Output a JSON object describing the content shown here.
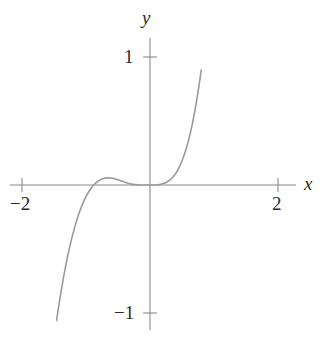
{
  "figure": {
    "background_color": "#ffffff",
    "axis_color": "#8a8a8a",
    "curve_color": "#9a9a9a",
    "text_color": "#2b2b2b"
  },
  "labels": {
    "x_axis": "x",
    "y_axis": "y"
  },
  "ticks": {
    "x_neg2": "−2",
    "x_pos2": "2",
    "y_pos1": "1",
    "y_neg1": "−1"
  },
  "chart_data": {
    "type": "line",
    "title": "",
    "subtitle": "",
    "xlabel": "x",
    "ylabel": "y",
    "xlim": [
      -2.2,
      2.3
    ],
    "ylim": [
      -1.15,
      1.15
    ],
    "xticks": [
      -2,
      2
    ],
    "xtick_labels": [
      "−2",
      "2"
    ],
    "yticks": [
      -1,
      1
    ],
    "ytick_labels": [
      "−1",
      "1"
    ],
    "grid": false,
    "legend": null,
    "legend_position": "none",
    "annotations": [],
    "series": [
      {
        "name": "curve",
        "color": "#9a9a9a",
        "line_width": 1.6,
        "x": [
          -1.46,
          -1.42,
          -1.38,
          -1.34,
          -1.3,
          -1.26,
          -1.22,
          -1.18,
          -1.14,
          -1.1,
          -1.06,
          -1.02,
          -0.98,
          -0.94,
          -0.9,
          -0.86,
          -0.82,
          -0.78,
          -0.74,
          -0.7,
          -0.66,
          -0.62,
          -0.58,
          -0.54,
          -0.5,
          -0.46,
          -0.42,
          -0.38,
          -0.34,
          -0.3,
          -0.26,
          -0.22,
          -0.18,
          -0.14,
          -0.1,
          -0.06,
          -0.02,
          0.0,
          0.02,
          0.06,
          0.1,
          0.14,
          0.18,
          0.22,
          0.26,
          0.3,
          0.34,
          0.38,
          0.42,
          0.46,
          0.5,
          0.54,
          0.58,
          0.62,
          0.66,
          0.7,
          0.74,
          0.78,
          0.8
        ],
        "y": [
          -1.058,
          -0.925,
          -0.803,
          -0.691,
          -0.588,
          -0.495,
          -0.411,
          -0.335,
          -0.268,
          -0.208,
          -0.156,
          -0.11,
          -0.072,
          -0.039,
          -0.012,
          0.01,
          0.027,
          0.04,
          0.049,
          0.054,
          0.056,
          0.055,
          0.052,
          0.047,
          0.041,
          0.034,
          0.027,
          0.02,
          0.014,
          0.009,
          0.005,
          0.003,
          0.001,
          0.0,
          0.0,
          0.0,
          0.0,
          0.0,
          0.0,
          0.0,
          0.001,
          0.003,
          0.007,
          0.013,
          0.022,
          0.035,
          0.052,
          0.075,
          0.105,
          0.143,
          0.188,
          0.243,
          0.308,
          0.385,
          0.474,
          0.576,
          0.693,
          0.825,
          0.898
        ]
      }
    ]
  },
  "geometry": {
    "origin_px": [
      150,
      185
    ],
    "x_unit_px": 64,
    "y_unit_px": 128,
    "x_axis_extent_px": [
      10,
      296
    ],
    "y_axis_extent_px": [
      38,
      330
    ],
    "tick_half_length_px": 7
  }
}
